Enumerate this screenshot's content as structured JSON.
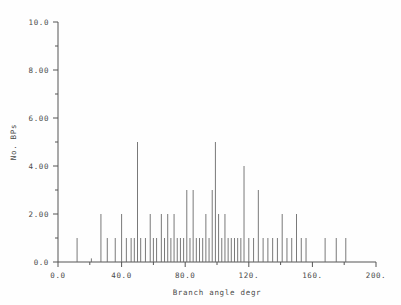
{
  "figure": {
    "title": "",
    "background": "#ffffff",
    "line_color": "#6a6a6a",
    "axis_color": "#555555"
  },
  "chart_data": {
    "type": "bar",
    "title": "",
    "subtitle": "",
    "xlabel": "Branch angle degr",
    "ylabel": "No. BPs",
    "xlim": [
      0,
      200
    ],
    "ylim": [
      0,
      10
    ],
    "grid": false,
    "legend": null,
    "xticks": [
      0,
      40,
      80,
      120,
      160,
      200
    ],
    "xticklabels": [
      "0.0",
      "40.0",
      "80.0",
      "120.",
      "160.",
      "200."
    ],
    "xminorticks": [
      20,
      60,
      100,
      140,
      180
    ],
    "yticks": [
      0,
      2,
      4,
      6,
      8,
      10
    ],
    "yticklabels": [
      "0.0",
      "2.00",
      "4.00",
      "6.00",
      "8.00",
      "10.0"
    ],
    "yminorticks": [
      1,
      3,
      5,
      7,
      9
    ],
    "x": [
      12,
      21,
      27,
      31,
      36,
      40,
      43,
      46,
      48,
      50,
      52,
      55,
      58,
      60,
      62,
      65,
      67,
      69,
      71,
      73,
      75,
      77,
      79,
      81,
      83,
      85,
      87,
      89,
      91,
      93,
      95,
      97,
      99,
      101,
      103,
      105,
      107,
      109,
      111,
      113,
      115,
      117,
      120,
      123,
      126,
      129,
      132,
      135,
      138,
      141,
      144,
      147,
      150,
      153,
      156,
      168,
      175,
      181
    ],
    "values": [
      1,
      0.15,
      2,
      1,
      1,
      2,
      1,
      1,
      1,
      5,
      1,
      1,
      2,
      1,
      1,
      2,
      1,
      2,
      1,
      2,
      1,
      1,
      1,
      3,
      1,
      3,
      1,
      1,
      1,
      2,
      1,
      3,
      5,
      2,
      1,
      2,
      1,
      1,
      1,
      1,
      1,
      4,
      1,
      1,
      3,
      1,
      1,
      1,
      1,
      2,
      1,
      1,
      2,
      1,
      1,
      1,
      1,
      1
    ],
    "xunits": "degrees",
    "yunits": "count"
  }
}
